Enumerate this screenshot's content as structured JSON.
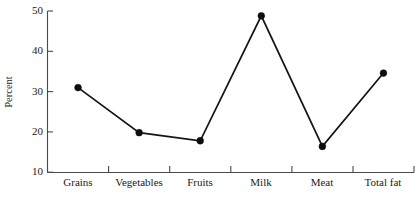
{
  "chart_data": {
    "type": "line",
    "title": "",
    "subtitle": "",
    "xlabel": "",
    "ylabel": "Percent",
    "categories": [
      "Grains",
      "Vegetables",
      "Fruits",
      "Milk",
      "Meat",
      "Total fat"
    ],
    "values": [
      31.0,
      19.8,
      17.8,
      48.8,
      16.4,
      34.6
    ],
    "series": [
      {
        "name": "Percent",
        "values": [
          31.0,
          19.8,
          17.8,
          48.8,
          16.4,
          34.6
        ]
      }
    ],
    "ylim": [
      10,
      50
    ],
    "yticks": [
      10,
      20,
      30,
      40,
      50
    ],
    "ytick_labels": [
      "10",
      "20",
      "30",
      "40",
      "50"
    ],
    "grid": false,
    "legend": "none",
    "marker": "filled-circle",
    "line_color": "#141414",
    "marker_color": "#0d0d0d",
    "axis_color": "#4a4a4a"
  },
  "axes": {
    "y_label": "Percent",
    "y_ticks": [
      "10",
      "20",
      "30",
      "40",
      "50"
    ],
    "x_ticks": [
      "Grains",
      "Vegetables",
      "Fruits",
      "Milk",
      "Meat",
      "Total fat"
    ]
  }
}
